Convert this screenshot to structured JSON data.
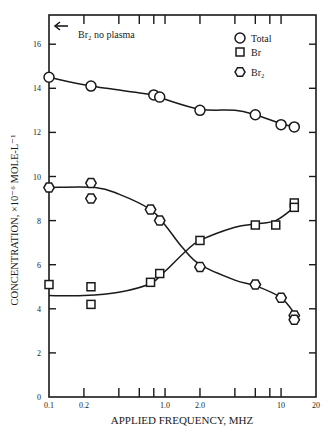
{
  "chart_data": {
    "type": "line",
    "title": "",
    "xlabel": "APPLIED FREQUENCY, MHZ",
    "ylabel": "CONCENTRATION, ×10⁻⁶ MOLE-L⁻¹",
    "xscale": "log",
    "xlim": [
      0.1,
      20
    ],
    "ylim": [
      0,
      17
    ],
    "x_tick_labels": [
      "0.1",
      "0.2",
      "1.0",
      "2.0",
      "10",
      "20"
    ],
    "x_tick_values": [
      0.1,
      0.2,
      1.0,
      2.0,
      10,
      20
    ],
    "x_minor_ticks": [
      0.4,
      0.6,
      0.8,
      4,
      6,
      8
    ],
    "y_tick_labels": [
      "0",
      "2",
      "4",
      "6",
      "8",
      "10",
      "12",
      "14",
      "16"
    ],
    "y_tick_values": [
      0,
      2,
      4,
      6,
      8,
      10,
      12,
      14,
      16
    ],
    "grid": false,
    "legend_position": "upper right",
    "annotations": [
      {
        "text": "Br₂ no plasma",
        "type": "arrow-left",
        "x": 0.1,
        "y": 16.7
      }
    ],
    "series": [
      {
        "name": "Total",
        "marker": "circle",
        "points": [
          {
            "x": 0.1,
            "y": 14.5
          },
          {
            "x": 0.23,
            "y": 14.1
          },
          {
            "x": 0.8,
            "y": 13.7
          },
          {
            "x": 0.9,
            "y": 13.6
          },
          {
            "x": 2.0,
            "y": 13.0
          },
          {
            "x": 6.0,
            "y": 12.8
          },
          {
            "x": 10.0,
            "y": 12.35
          },
          {
            "x": 13.0,
            "y": 12.25
          }
        ],
        "fit_curve": [
          [
            0.1,
            14.5
          ],
          [
            0.23,
            14.1
          ],
          [
            0.8,
            13.7
          ],
          [
            1.0,
            13.5
          ],
          [
            2.0,
            13.05
          ],
          [
            4.0,
            13.0
          ],
          [
            6.0,
            12.8
          ],
          [
            10.0,
            12.4
          ],
          [
            13.0,
            12.25
          ]
        ]
      },
      {
        "name": "Br",
        "marker": "square",
        "points": [
          {
            "x": 0.1,
            "y": 5.1
          },
          {
            "x": 0.23,
            "y": 5.0
          },
          {
            "x": 0.23,
            "y": 4.2
          },
          {
            "x": 0.75,
            "y": 5.2
          },
          {
            "x": 0.9,
            "y": 5.6
          },
          {
            "x": 2.0,
            "y": 7.1
          },
          {
            "x": 6.0,
            "y": 7.8
          },
          {
            "x": 9.0,
            "y": 7.8
          },
          {
            "x": 13.0,
            "y": 8.8
          },
          {
            "x": 13.0,
            "y": 8.6
          }
        ],
        "fit_curve": [
          [
            0.1,
            4.6
          ],
          [
            0.2,
            4.6
          ],
          [
            0.4,
            4.75
          ],
          [
            0.75,
            5.15
          ],
          [
            1.0,
            5.7
          ],
          [
            1.5,
            6.6
          ],
          [
            2.0,
            7.1
          ],
          [
            4.0,
            7.7
          ],
          [
            6.0,
            7.85
          ],
          [
            9.0,
            8.0
          ],
          [
            13.0,
            8.6
          ]
        ]
      },
      {
        "name": "Br₂",
        "marker": "hexagon",
        "points": [
          {
            "x": 0.1,
            "y": 9.5
          },
          {
            "x": 0.23,
            "y": 9.7
          },
          {
            "x": 0.23,
            "y": 9.0
          },
          {
            "x": 0.75,
            "y": 8.5
          },
          {
            "x": 0.9,
            "y": 8.0
          },
          {
            "x": 2.0,
            "y": 5.9
          },
          {
            "x": 6.0,
            "y": 5.1
          },
          {
            "x": 10.0,
            "y": 4.5
          },
          {
            "x": 13.0,
            "y": 3.7
          },
          {
            "x": 13.0,
            "y": 3.5
          }
        ],
        "fit_curve": [
          [
            0.1,
            9.5
          ],
          [
            0.25,
            9.5
          ],
          [
            0.4,
            9.2
          ],
          [
            0.75,
            8.5
          ],
          [
            1.0,
            7.8
          ],
          [
            1.4,
            6.8
          ],
          [
            2.0,
            6.0
          ],
          [
            4.0,
            5.3
          ],
          [
            6.0,
            5.05
          ],
          [
            10.0,
            4.5
          ],
          [
            13.0,
            3.8
          ]
        ]
      }
    ]
  },
  "legend": {
    "items": [
      {
        "label": "Total",
        "marker": "circle"
      },
      {
        "label": "Br",
        "marker": "square"
      },
      {
        "label": "Br₂",
        "marker": "hexagon"
      }
    ]
  },
  "labels": {
    "annotation": "Br₂ no plasma",
    "xlabel": "APPLIED FREQUENCY, MHZ",
    "ylabel": "CONCENTRATION, ×10⁻⁶ MOLE-L⁻¹"
  }
}
